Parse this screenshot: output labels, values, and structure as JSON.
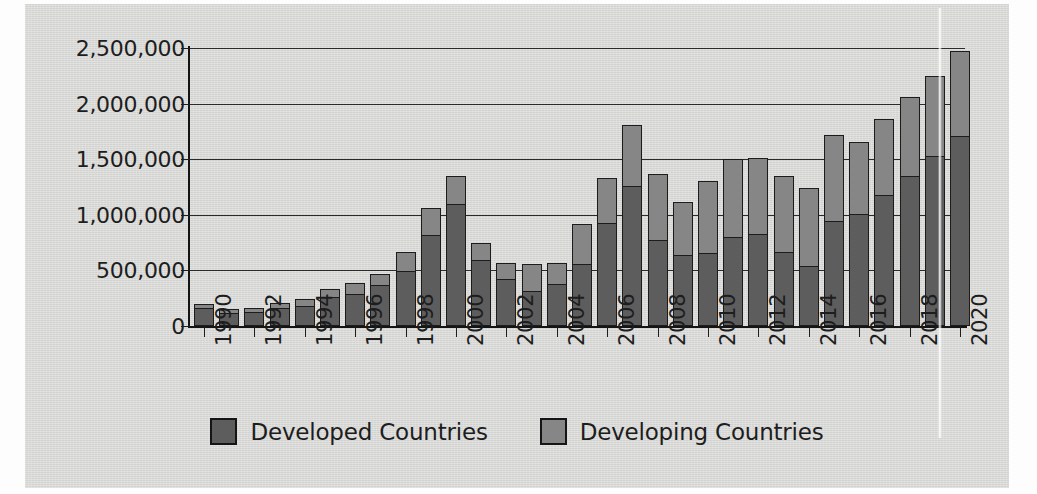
{
  "chart_data": {
    "type": "bar",
    "subtype": "stacked-bar",
    "title": "",
    "xlabel": "",
    "ylabel": "",
    "ylim": [
      0,
      2500000
    ],
    "ytick_labels": [
      "0",
      "500,000",
      "1,000,000",
      "1,500,000",
      "2,000,000",
      "2,500,000"
    ],
    "ytick_values": [
      0,
      500000,
      1000000,
      1500000,
      2000000,
      2500000
    ],
    "grid": true,
    "legend_position": "bottom",
    "xtick_labels": [
      "1990",
      "1992",
      "1994",
      "1996",
      "1998",
      "2000",
      "2002",
      "2004",
      "2006",
      "2008",
      "2010",
      "2012",
      "2014",
      "2016",
      "2018",
      "2020"
    ],
    "categories": [
      "1990",
      "1991",
      "1992",
      "1993",
      "1994",
      "1995",
      "1996",
      "1997",
      "1998",
      "1999",
      "2000",
      "2001",
      "2002",
      "2003",
      "2004",
      "2005",
      "2006",
      "2007",
      "2008",
      "2009",
      "2010",
      "2011",
      "2012",
      "2013",
      "2014",
      "2015",
      "2016",
      "2017",
      "2018",
      "2019",
      "2020"
    ],
    "series": [
      {
        "name": "Developed Countries",
        "color": "#5d5d5d",
        "values": [
          165000,
          125000,
          130000,
          165000,
          185000,
          265000,
          290000,
          370000,
          500000,
          825000,
          1100000,
          600000,
          425000,
          320000,
          380000,
          560000,
          930000,
          1265000,
          775000,
          640000,
          660000,
          800000,
          830000,
          670000,
          545000,
          950000,
          1015000,
          1180000,
          1350000,
          1530000,
          1710000
        ]
      },
      {
        "name": "Developing Countries",
        "color": "#868686",
        "values": [
          35000,
          25000,
          30000,
          40000,
          60000,
          70000,
          100000,
          95000,
          170000,
          235000,
          245000,
          150000,
          145000,
          235000,
          185000,
          355000,
          405000,
          540000,
          595000,
          475000,
          640000,
          705000,
          680000,
          675000,
          700000,
          770000,
          640000,
          685000,
          710000,
          720000,
          760000
        ]
      }
    ],
    "totals": [
      200000,
      150000,
      160000,
      205000,
      245000,
      335000,
      390000,
      465000,
      670000,
      1060000,
      1345000,
      750000,
      570000,
      555000,
      565000,
      915000,
      1335000,
      1805000,
      1370000,
      1115000,
      1300000,
      1505000,
      1510000,
      1345000,
      1245000,
      1720000,
      1655000,
      1865000,
      2060000,
      2250000,
      2470000
    ]
  },
  "legend": {
    "items": [
      {
        "label": "Developed Countries",
        "color": "#5d5d5d"
      },
      {
        "label": "Developing Countries",
        "color": "#868686"
      }
    ]
  }
}
